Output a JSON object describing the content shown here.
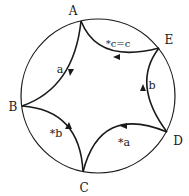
{
  "diagram": {
    "type": "hyperbolic-disk-polygon",
    "circle": {
      "cx": 98,
      "cy": 96,
      "r": 77
    },
    "vertices": [
      {
        "id": "A",
        "label": "A",
        "x": 81,
        "y": 21,
        "lx": 73,
        "ly": 15
      },
      {
        "id": "E",
        "label": "E",
        "x": 159,
        "y": 48,
        "lx": 168,
        "ly": 43
      },
      {
        "id": "D",
        "label": "D",
        "x": 167,
        "y": 132,
        "lx": 178,
        "ly": 144
      },
      {
        "id": "C",
        "label": "C",
        "x": 83,
        "y": 172,
        "lx": 84,
        "ly": 191
      },
      {
        "id": "B",
        "label": "B",
        "x": 22,
        "y": 106,
        "lx": 13,
        "ly": 111
      }
    ],
    "edges": [
      {
        "from": "A",
        "to": "B",
        "label": "a",
        "lx": 60,
        "ly": 73
      },
      {
        "from": "A",
        "to": "E",
        "label": "*c=c",
        "lx": 105,
        "ly": 46
      },
      {
        "from": "E",
        "to": "D",
        "label": "b",
        "lx": 152,
        "ly": 88
      },
      {
        "from": "D",
        "to": "C",
        "label": "*a",
        "lx": 120,
        "ly": 145
      },
      {
        "from": "B",
        "to": "C",
        "label": "*b",
        "lx": 52,
        "ly": 136
      }
    ],
    "stroke_color": "#1a1a1a",
    "background": "#ffffff"
  }
}
